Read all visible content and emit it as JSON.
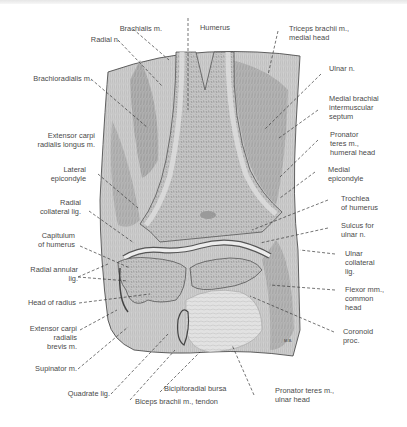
{
  "figure": {
    "signature": "M.B.",
    "colors": {
      "background": "#ffffff",
      "tissue": "#c9c9c9",
      "bone": "#b4b4b4",
      "line": "#3a3a3a",
      "text": "#4a4a4a"
    }
  },
  "labels": {
    "left": [
      {
        "id": "brachialis",
        "text": "Brachialis m."
      },
      {
        "id": "radial_n",
        "text": "Radial n."
      },
      {
        "id": "brachioradialis",
        "text": "Brachioradialis m."
      },
      {
        "id": "ecrl_1",
        "text": "Extensor carpi"
      },
      {
        "id": "ecrl_2",
        "text": "radialis longus m."
      },
      {
        "id": "lat_epi_1",
        "text": "Lateral"
      },
      {
        "id": "lat_epi_2",
        "text": "epicondyle"
      },
      {
        "id": "rad_coll_1",
        "text": "Radial"
      },
      {
        "id": "rad_coll_2",
        "text": "collateral lig."
      },
      {
        "id": "capit_1",
        "text": "Capitulum"
      },
      {
        "id": "capit_2",
        "text": "of humerus"
      },
      {
        "id": "rad_ann_1",
        "text": "Radial annular"
      },
      {
        "id": "rad_ann_2",
        "text": "lig."
      },
      {
        "id": "head_radius",
        "text": "Head of radius"
      },
      {
        "id": "ecrb_1",
        "text": "Extensor carpi"
      },
      {
        "id": "ecrb_2",
        "text": "radialis"
      },
      {
        "id": "ecrb_3",
        "text": "brevis m."
      },
      {
        "id": "supinator",
        "text": "Supinator m."
      },
      {
        "id": "quadrate",
        "text": "Quadrate lig."
      }
    ],
    "top": [
      {
        "id": "humerus",
        "text": "Humerus"
      }
    ],
    "right": [
      {
        "id": "triceps_1",
        "text": "Triceps brachii m.,"
      },
      {
        "id": "triceps_2",
        "text": "medial head"
      },
      {
        "id": "ulnar_n",
        "text": "Ulnar n."
      },
      {
        "id": "mbis_1",
        "text": "Medial brachial"
      },
      {
        "id": "mbis_2",
        "text": "intermuscular"
      },
      {
        "id": "mbis_3",
        "text": "septum"
      },
      {
        "id": "pt_hh_1",
        "text": "Pronator"
      },
      {
        "id": "pt_hh_2",
        "text": "teres m.,"
      },
      {
        "id": "pt_hh_3",
        "text": "humeral head"
      },
      {
        "id": "med_epi_1",
        "text": "Medial"
      },
      {
        "id": "med_epi_2",
        "text": "epicondyle"
      },
      {
        "id": "troch_1",
        "text": "Trochlea"
      },
      {
        "id": "troch_2",
        "text": "of humerus"
      },
      {
        "id": "sulcus_1",
        "text": "Sulcus for"
      },
      {
        "id": "sulcus_2",
        "text": "ulnar n."
      },
      {
        "id": "ulnar_coll_1",
        "text": "Ulnar"
      },
      {
        "id": "ulnar_coll_2",
        "text": "collateral"
      },
      {
        "id": "ulnar_coll_3",
        "text": "lig."
      },
      {
        "id": "flexor_1",
        "text": "Flexor mm.,"
      },
      {
        "id": "flexor_2",
        "text": "common"
      },
      {
        "id": "flexor_3",
        "text": "head"
      },
      {
        "id": "coronoid_1",
        "text": "Coronoid"
      },
      {
        "id": "coronoid_2",
        "text": "proc."
      }
    ],
    "bottom": [
      {
        "id": "bicipitoradial",
        "text": "Bicipitoradial bursa"
      },
      {
        "id": "biceps_tendon",
        "text": "Biceps brachii m., tendon"
      },
      {
        "id": "pt_uh_1",
        "text": "Pronator teres m.,"
      },
      {
        "id": "pt_uh_2",
        "text": "ulnar head"
      }
    ]
  }
}
